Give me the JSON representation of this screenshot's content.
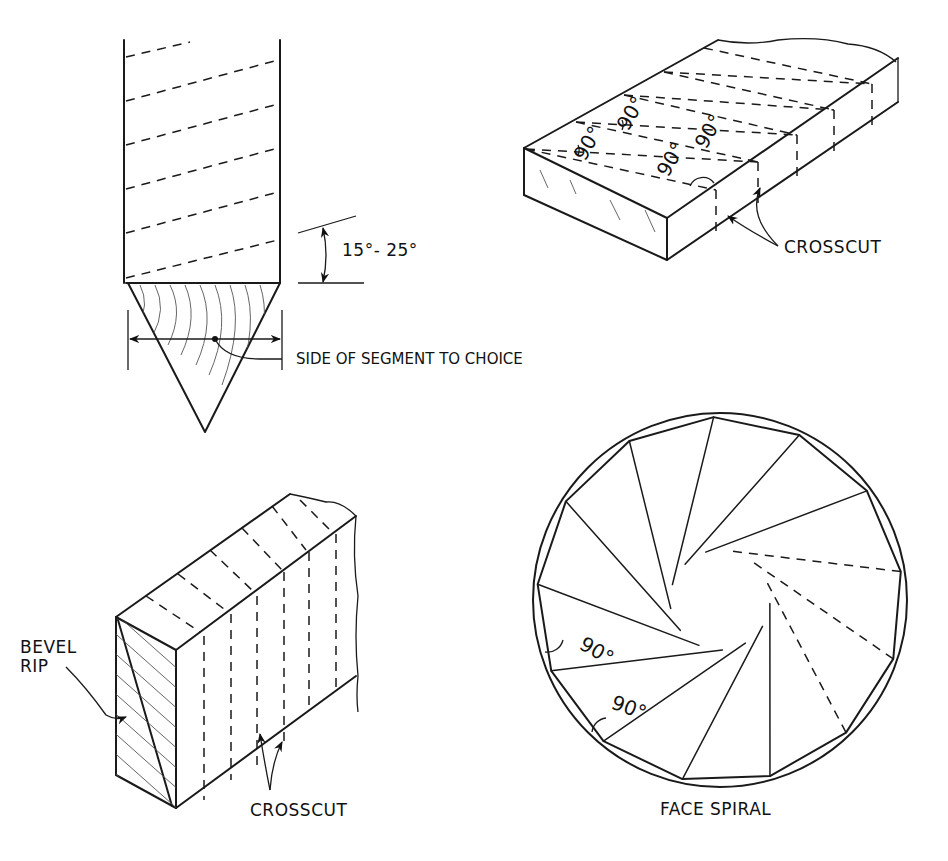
{
  "figure": {
    "segment_view": {
      "angle_label": "15°- 25°",
      "side_label": "SIDE OF SEGMENT TO CHOICE"
    },
    "board_top_right": {
      "angle_labels": [
        "90°",
        "90°",
        "90°",
        "90°"
      ],
      "crosscut_label": "CROSSCUT"
    },
    "board_bottom_left": {
      "bevel_label_line1": "BEVEL",
      "bevel_label_line2": "RIP",
      "crosscut_label": "CROSSCUT"
    },
    "face_spiral": {
      "title": "FACE SPIRAL",
      "angle_labels": [
        "90°",
        "90°"
      ],
      "segment_count": 13
    }
  }
}
